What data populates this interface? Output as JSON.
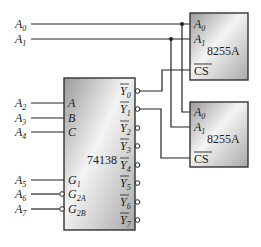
{
  "diagram": {
    "address_lines_top": [
      "A0",
      "A1"
    ],
    "decoder": {
      "name": "74138",
      "inputs": [
        {
          "signal": "A2",
          "pin": "A"
        },
        {
          "signal": "A3",
          "pin": "B"
        },
        {
          "signal": "A4",
          "pin": "C"
        },
        {
          "signal": "A5",
          "pin": "G1"
        },
        {
          "signal": "A6",
          "pin": "G2A",
          "active_low": true
        },
        {
          "signal": "A7",
          "pin": "G2B",
          "active_low": true
        }
      ],
      "outputs": [
        "Y0",
        "Y1",
        "Y2",
        "Y3",
        "Y4",
        "Y5",
        "Y6",
        "Y7"
      ]
    },
    "chips": [
      {
        "name": "8255A",
        "pins": [
          "A0",
          "A1",
          "CS"
        ],
        "cs_from": "Y0"
      },
      {
        "name": "8255A",
        "pins": [
          "A0",
          "A1",
          "CS"
        ],
        "cs_from": "Y1"
      }
    ],
    "text": {
      "decoder_name": "74138",
      "chip1_name": "8255A",
      "chip2_name": "8255A",
      "cs_label": "CS",
      "pin_a": "A",
      "pin_b": "B",
      "pin_c": "C",
      "pin_g": "G",
      "y": "Y",
      "a": "A"
    }
  }
}
